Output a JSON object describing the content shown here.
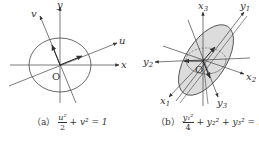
{
  "figure_a": {
    "axis_labels": {
      "x": "x",
      "y": "y",
      "u": "u",
      "v": "v",
      "origin": "O"
    },
    "caption": {
      "tag": "（a）",
      "formula": "u²/2 + v² = 1",
      "num": "u²",
      "den": "2",
      "rest": "+ v² = 1"
    }
  },
  "figure_b": {
    "axis_labels": {
      "x1": "x",
      "x1_sub": "1",
      "x2": "x",
      "x2_sub": "2",
      "x3": "x",
      "x3_sub": "3",
      "y1": "y",
      "y1_sub": "1",
      "y2": "y",
      "y2_sub": "2",
      "y3": "y",
      "y3_sub": "3",
      "origin": "O"
    },
    "caption": {
      "tag": "（b）",
      "formula": "y₁²/4 + y₂² + y₃² = 1",
      "num": "y₁²",
      "den": "4",
      "rest": "+ y₂² + y₃² = 1"
    },
    "fill_color": "#dcdcdc"
  },
  "stroke_color": "#444444"
}
